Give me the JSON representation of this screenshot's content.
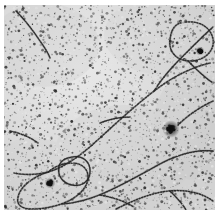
{
  "image": {
    "kind": "electron-micrograph",
    "title": "Transmission electron micrograph",
    "subject": "chromatin / DNA filaments on grainy stained substrate",
    "width_px": 219,
    "height_px": 212,
    "field_left_px": 4,
    "field_top_px": 5,
    "field_width_px": 211,
    "field_height_px": 205,
    "caption": "",
    "scale_bar_label": "",
    "annotations": []
  },
  "palette": {
    "paper_white": "#ffffff",
    "background_gray": "#d9d9d9",
    "background_gray_light": "#e6e6e6",
    "background_gray_dark": "#c4c4c4",
    "grain_dark": "#1e1e1e",
    "grain_mid": "#555555",
    "filament_dark": "#242424",
    "filament_mid": "#4a4a4a",
    "aggregate_black": "#101010"
  },
  "texture": {
    "grain_description": "dense fine dark speckle covering entire field",
    "grain_density": "high",
    "grain_dot_count": 2600,
    "grain_dot_min_radius": 0.35,
    "grain_dot_max_radius": 1.5,
    "noise_seed": 20240517,
    "base_tone_note": "light neutral gray emulsion with subtle mottling"
  },
  "features": {
    "filaments": [
      {
        "name": "top-left-short-diagonal",
        "description": "short dark diagonal streak entering from the upper-left corner running down-right",
        "path": "M 12 6 C 20 14, 28 24, 36 36 C 41 43, 44 48, 46 53"
      },
      {
        "name": "central-long-diagonal",
        "description": "prominent long filament sweeping from upper-right down to the left-center edge",
        "path": "M 206 58 C 188 62, 168 72, 150 86 C 128 103, 108 122, 88 140 C 72 154, 58 163, 44 167 C 32 170, 20 170, 10 168"
      },
      {
        "name": "upper-right-arc",
        "description": "long arcing filament across the top joining the central diagonal near its apex",
        "path": "M 150 86 C 156 76, 166 64, 178 52 C 190 40, 200 30, 209 22"
      },
      {
        "name": "upper-right-loop",
        "description": "closed loop of filament in the top-right corner region",
        "path": "M 176 18 C 192 14, 206 20, 209 34 C 211 46, 200 56, 186 56 C 172 56, 164 46, 166 34 C 167 26, 170 20, 176 18"
      },
      {
        "name": "right-upper-branch",
        "description": "short branch sloping down-right off the upper-right arc toward the right edge",
        "path": "M 184 56 C 192 64, 200 72, 209 78"
      },
      {
        "name": "mid-right-segment",
        "description": "faint filament crossing the middle-right area toward the dark aggregate",
        "path": "M 209 96 C 196 102, 184 110, 174 120"
      },
      {
        "name": "lower-central-sweep",
        "description": "second major filament curving from the right edge down-left past the small loop to the lower-left",
        "path": "M 209 146 C 192 144, 172 150, 154 160 C 136 170, 118 180, 100 188 C 86 194, 72 198, 58 199"
      },
      {
        "name": "lower-left-large-loop",
        "description": "big open loop in the lower-left quadrant",
        "path": "M 44 167 C 28 172, 16 182, 14 192 C 12 200, 18 204, 28 204 C 42 204, 58 200, 68 194 C 78 188, 84 180, 84 172 C 84 164, 78 158, 68 158 C 58 158, 50 162, 44 167"
      },
      {
        "name": "small-ring-loop",
        "description": "small distinct circular loop in the lower-left-of-center",
        "path": "M 68 152 C 78 150, 86 156, 86 166 C 86 176, 78 182, 68 180 C 58 178, 53 170, 55 161 C 57 155, 62 153, 68 152"
      },
      {
        "name": "bottom-right-arc",
        "description": "arc rising from the bottom edge toward the right edge in the lower-right corner",
        "path": "M 112 204 C 128 196, 146 188, 164 186 C 182 184, 198 188, 209 196"
      },
      {
        "name": "bottom-right-branch",
        "description": "short branch dropping from the bottom-right arc to the bottom edge",
        "path": "M 166 186 C 172 192, 178 198, 182 205"
      },
      {
        "name": "mid-left-fragment",
        "description": "short filament fragment in the left-middle region",
        "path": "M 6 126 C 16 128, 26 132, 34 138"
      },
      {
        "name": "center-fragment",
        "description": "faint short filament fragment near the center of the field",
        "path": "M 96 118 C 106 114, 116 112, 126 112"
      },
      {
        "name": "bottom-center-fragment",
        "description": "faint short filament fragment near the lower center",
        "path": "M 96 190 C 108 192, 120 196, 130 202"
      }
    ],
    "aggregates": [
      {
        "name": "right-dark-aggregate",
        "description": "prominent dense black cluster of grains on the right side",
        "cx": 167,
        "cy": 124,
        "r": 4.2
      },
      {
        "name": "lower-left-dark-spot",
        "description": "smaller dark cluster inside the lower-left loop",
        "cx": 46,
        "cy": 178,
        "r": 2.6
      },
      {
        "name": "top-right-dark-spot",
        "description": "dark cluster near the top-right loop interior",
        "cx": 196,
        "cy": 46,
        "r": 2.2
      }
    ]
  }
}
